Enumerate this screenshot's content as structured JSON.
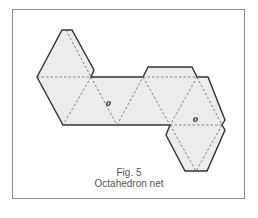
{
  "figure": {
    "number_label": "Fig. 5",
    "title": "Octahedron net",
    "fill_color": "#ececec",
    "cut_line_color": "#333333",
    "fold_line_color": "#666666",
    "labels": [
      {
        "text": "o",
        "face": "main-strip"
      },
      {
        "text": "o",
        "face": "lower-right"
      }
    ]
  }
}
